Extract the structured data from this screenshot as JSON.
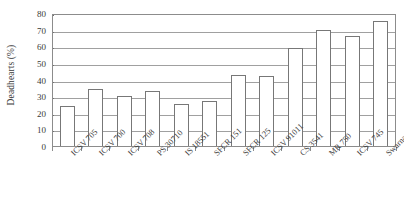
{
  "chart_data": {
    "type": "bar",
    "title": "",
    "xlabel": "",
    "ylabel": "Deadhearts (%)",
    "ylim": [
      0,
      80
    ],
    "ytick_step": 10,
    "yticks": [
      0,
      10,
      20,
      30,
      40,
      50,
      60,
      70,
      80
    ],
    "grid": true,
    "legend": "none",
    "bar_fill_color": "#ffffff",
    "bar_edge_color": "#777777",
    "gridline_color": "#a0a0a0",
    "axis_color": "#8c8c8c",
    "categories": [
      "ICSV 705",
      "ICSV 700",
      "ICSV 708",
      "PS 30710",
      "IS 18551",
      "SFCR 151",
      "SFCR 125",
      "ICSV 91011",
      "CS 3541",
      "MR 750",
      "ICSV 745",
      "Swarna"
    ],
    "values": [
      24,
      34,
      30,
      33,
      25,
      27,
      43,
      42,
      59,
      70,
      66,
      75
    ]
  }
}
